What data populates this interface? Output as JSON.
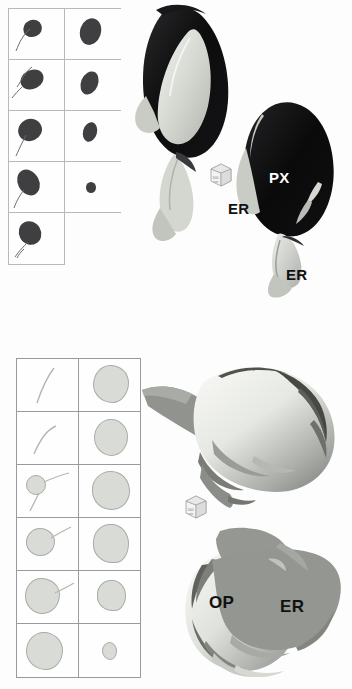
{
  "figure": {
    "background_color": "#fdfdfd",
    "panels": [
      {
        "id": "panel-top",
        "label": "",
        "gallery": {
          "name": "serial-section-gallery-top",
          "rows": 5,
          "columns": 2,
          "blob_fill": "#3f3f42",
          "border_color": "#b9b9bd",
          "cells": [
            {
              "row": 1,
              "col": 1,
              "shape": "dark-blob-with-tail",
              "present": true
            },
            {
              "row": 1,
              "col": 2,
              "shape": "dark-blob",
              "present": true
            },
            {
              "row": 2,
              "col": 1,
              "shape": "dark-blob-with-tail",
              "present": true
            },
            {
              "row": 2,
              "col": 2,
              "shape": "dark-blob",
              "present": true
            },
            {
              "row": 3,
              "col": 1,
              "shape": "dark-blob-with-tail",
              "present": true
            },
            {
              "row": 3,
              "col": 2,
              "shape": "dark-blob",
              "present": true
            },
            {
              "row": 4,
              "col": 1,
              "shape": "dark-blob-with-tail",
              "present": true
            },
            {
              "row": 4,
              "col": 2,
              "shape": "dark-blob-small",
              "present": true
            },
            {
              "row": 5,
              "col": 1,
              "shape": "dark-blob-with-tail",
              "present": true
            },
            {
              "row": 5,
              "col": 2,
              "shape": "none",
              "present": false
            }
          ]
        },
        "render": {
          "name": "render-peroxisome-er-dark",
          "primary_color": "#101010",
          "secondary_color": "#cfd2cb",
          "labels": [
            {
              "text": "PX",
              "color": "#ffffff",
              "x": 269,
              "y": 176
            },
            {
              "text": "ER",
              "color": "#111111",
              "x": 232,
              "y": 207
            },
            {
              "text": "ER",
              "color": "#111111",
              "x": 289,
              "y": 273
            }
          ]
        },
        "scale_cube": {
          "name": "scale-cube",
          "face_text": "500 nm",
          "x": 205,
          "y": 160
        }
      },
      {
        "id": "panel-bottom",
        "label": "",
        "gallery": {
          "name": "serial-section-gallery-bottom",
          "rows": 6,
          "columns": 2,
          "blob_fill": "#d9dcd6",
          "border_color": "#9a9a9e",
          "cells": [
            {
              "row": 1,
              "col": 1,
              "shape": "thin-tubule",
              "present": true
            },
            {
              "row": 1,
              "col": 2,
              "shape": "light-blob",
              "present": true
            },
            {
              "row": 2,
              "col": 1,
              "shape": "thin-tubule",
              "present": true
            },
            {
              "row": 2,
              "col": 2,
              "shape": "light-blob",
              "present": true
            },
            {
              "row": 3,
              "col": 1,
              "shape": "light-blob-small-with-tubule",
              "present": true
            },
            {
              "row": 3,
              "col": 2,
              "shape": "light-blob",
              "present": true
            },
            {
              "row": 4,
              "col": 1,
              "shape": "light-blob-with-tubule",
              "present": true
            },
            {
              "row": 4,
              "col": 2,
              "shape": "light-blob-notched",
              "present": true
            },
            {
              "row": 5,
              "col": 1,
              "shape": "light-blob-large-with-tubule",
              "present": true
            },
            {
              "row": 5,
              "col": 2,
              "shape": "light-blob-notched",
              "present": true
            },
            {
              "row": 6,
              "col": 1,
              "shape": "light-blob-large",
              "present": true
            },
            {
              "row": 6,
              "col": 2,
              "shape": "light-blob-tiny",
              "present": true
            }
          ]
        },
        "render_top": {
          "name": "render-oil-body-light",
          "primary_color": "#e2e4df",
          "shadow_color": "#5d6060"
        },
        "render_bottom": {
          "name": "render-oleosome-er",
          "primary_color": "#dfe1dc",
          "secondary_color": "#9b9e98",
          "labels": [
            {
              "text": "OP",
              "color": "#111111",
              "x": 212,
              "y": 602
            },
            {
              "text": "ER",
              "color": "#111111",
              "x": 282,
              "y": 608
            }
          ]
        },
        "scale_cube": {
          "name": "scale-cube",
          "face_text": "500 nm",
          "x": 180,
          "y": 492
        }
      }
    ],
    "annotations": {
      "PX": "peroxisome",
      "ER": "endoplasmic reticulum",
      "OP": "oleosome / oil body"
    }
  }
}
